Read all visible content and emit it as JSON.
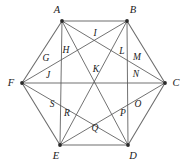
{
  "figure": {
    "canvas": {
      "width": 187,
      "height": 165
    },
    "colors": {
      "background": "#ffffff",
      "edge_stroke": "#6e6e6e",
      "diagonal_stroke": "#595959",
      "vertex_dot": "#2b2b2b",
      "label_text": "#1a1a1a"
    },
    "vertices": [
      {
        "id": "A",
        "label": "A",
        "x": 62,
        "y": 21,
        "label_x": 57,
        "label_y": 10
      },
      {
        "id": "B",
        "label": "B",
        "x": 127,
        "y": 21,
        "label_x": 133,
        "label_y": 10
      },
      {
        "id": "C",
        "label": "C",
        "x": 165,
        "y": 83,
        "label_x": 176,
        "label_y": 83
      },
      {
        "id": "D",
        "label": "D",
        "x": 128,
        "y": 145,
        "label_x": 133,
        "label_y": 156
      },
      {
        "id": "E",
        "label": "E",
        "x": 60,
        "y": 145,
        "label_x": 56,
        "label_y": 156
      },
      {
        "id": "F",
        "label": "F",
        "x": 22,
        "y": 83,
        "label_x": 11,
        "label_y": 83
      }
    ],
    "inner_points": [
      {
        "id": "G",
        "label": "G",
        "label_x": 46,
        "label_y": 59
      },
      {
        "id": "H",
        "label": "H",
        "label_x": 66,
        "label_y": 51
      },
      {
        "id": "I",
        "label": "I",
        "label_x": 95,
        "label_y": 34
      },
      {
        "id": "J",
        "label": "J",
        "label_x": 48,
        "label_y": 76
      },
      {
        "id": "K",
        "label": "K",
        "label_x": 96,
        "label_y": 70
      },
      {
        "id": "L",
        "label": "L",
        "label_x": 122,
        "label_y": 52
      },
      {
        "id": "M",
        "label": "M",
        "label_x": 137,
        "label_y": 58
      },
      {
        "id": "N",
        "label": "N",
        "label_x": 136,
        "label_y": 75
      },
      {
        "id": "O",
        "label": "O",
        "label_x": 138,
        "label_y": 105
      },
      {
        "id": "P",
        "label": "P",
        "label_x": 123,
        "label_y": 114
      },
      {
        "id": "Q",
        "label": "Q",
        "label_x": 95,
        "label_y": 129
      },
      {
        "id": "R",
        "label": "R",
        "label_x": 67,
        "label_y": 114
      },
      {
        "id": "S",
        "label": "S",
        "label_x": 52,
        "label_y": 105
      }
    ],
    "edges": [
      {
        "from": "A",
        "to": "B"
      },
      {
        "from": "B",
        "to": "C"
      },
      {
        "from": "C",
        "to": "D"
      },
      {
        "from": "D",
        "to": "E"
      },
      {
        "from": "E",
        "to": "F"
      },
      {
        "from": "F",
        "to": "A"
      }
    ],
    "diagonals": [
      {
        "from": "A",
        "to": "C"
      },
      {
        "from": "A",
        "to": "D"
      },
      {
        "from": "A",
        "to": "E"
      },
      {
        "from": "B",
        "to": "D"
      },
      {
        "from": "B",
        "to": "E"
      },
      {
        "from": "B",
        "to": "F"
      },
      {
        "from": "C",
        "to": "E"
      },
      {
        "from": "C",
        "to": "F"
      },
      {
        "from": "D",
        "to": "F"
      }
    ]
  }
}
